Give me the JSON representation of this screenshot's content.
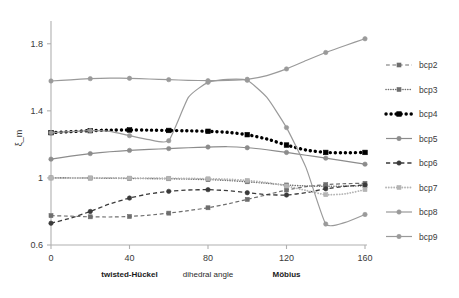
{
  "chart_data": {
    "type": "line",
    "title": "",
    "xlabel": "dihedral angle",
    "ylabel": "ξ_m",
    "xlim": [
      0,
      160
    ],
    "ylim": [
      0.6,
      1.9
    ],
    "xticks": [
      "0",
      "40",
      "80",
      "120",
      "160"
    ],
    "xtick_values": [
      0,
      40,
      80,
      120,
      160
    ],
    "yticks": [
      "0.6",
      "1",
      "1.4",
      "1.8"
    ],
    "ytick_values": [
      0.6,
      1.0,
      1.4,
      1.8
    ],
    "grid": false,
    "legend_position": "right",
    "annotations": [
      {
        "text": "twisted-Hückel",
        "x": 40,
        "bold": true
      },
      {
        "text": "dihedral angle",
        "x": 80,
        "bold": false
      },
      {
        "text": "Möbius",
        "x": 120,
        "bold": true
      }
    ],
    "x": [
      0,
      10,
      20,
      30,
      40,
      50,
      60,
      70,
      80,
      90,
      100,
      110,
      120,
      130,
      140,
      150,
      160
    ],
    "series": [
      {
        "name": "bcp2",
        "style": "dashed",
        "color": "#6e6e6e",
        "width": 1.2,
        "marker": "square",
        "values": [
          0.775,
          0.772,
          0.768,
          0.767,
          0.77,
          0.778,
          0.79,
          0.805,
          0.822,
          0.845,
          0.872,
          0.9,
          0.928,
          0.948,
          0.96,
          0.966,
          0.968
        ]
      },
      {
        "name": "bcp3",
        "style": "dotted",
        "color": "#707070",
        "width": 1.6,
        "marker": "square",
        "values": [
          1.0,
          1.0,
          0.999,
          0.998,
          0.997,
          0.996,
          0.995,
          0.993,
          0.99,
          0.985,
          0.977,
          0.968,
          0.958,
          0.952,
          0.95,
          0.951,
          0.953
        ]
      },
      {
        "name": "bcp4",
        "style": "dotted",
        "color": "#000000",
        "width": 3.4,
        "marker": "square",
        "values": [
          1.27,
          1.276,
          1.282,
          1.285,
          1.286,
          1.285,
          1.283,
          1.281,
          1.278,
          1.272,
          1.258,
          1.232,
          1.196,
          1.166,
          1.152,
          1.15,
          1.152
        ]
      },
      {
        "name": "bcp5",
        "style": "solid",
        "color": "#8c8c8c",
        "width": 1.2,
        "marker": "circle",
        "values": [
          1.112,
          1.13,
          1.145,
          1.156,
          1.164,
          1.17,
          1.175,
          1.18,
          1.184,
          1.186,
          1.18,
          1.168,
          1.152,
          1.135,
          1.118,
          1.1,
          1.082
        ]
      },
      {
        "name": "bcp6",
        "style": "dashed",
        "color": "#3a3a3a",
        "width": 1.3,
        "marker": "circle",
        "values": [
          0.73,
          0.76,
          0.8,
          0.845,
          0.88,
          0.905,
          0.92,
          0.928,
          0.93,
          0.924,
          0.912,
          0.9,
          0.898,
          0.912,
          0.935,
          0.95,
          0.958
        ]
      },
      {
        "name": "bcp7",
        "style": "dotted",
        "color": "#b4b4b4",
        "width": 1.8,
        "marker": "square",
        "values": [
          1.0,
          1.0,
          1.0,
          1.0,
          0.999,
          0.998,
          0.998,
          0.997,
          0.995,
          0.992,
          0.985,
          0.972,
          0.952,
          0.925,
          0.9,
          0.905,
          0.93
        ]
      },
      {
        "name": "bcp8",
        "style": "solid",
        "color": "#9a9a9a",
        "width": 1.2,
        "marker": "circle",
        "values": [
          1.27,
          1.276,
          1.282,
          1.278,
          1.252,
          1.228,
          1.222,
          1.48,
          1.57,
          1.588,
          1.582,
          1.48,
          1.3,
          1.06,
          0.725,
          0.735,
          0.782
        ]
      },
      {
        "name": "bcp9",
        "style": "solid",
        "color": "#9a9a9a",
        "width": 1.2,
        "marker": "circle",
        "values": [
          1.578,
          1.585,
          1.592,
          1.595,
          1.594,
          1.59,
          1.586,
          1.582,
          1.58,
          1.582,
          1.588,
          1.61,
          1.65,
          1.7,
          1.748,
          1.79,
          1.83
        ]
      }
    ]
  },
  "legend": {
    "items": [
      {
        "label": "bcp2"
      },
      {
        "label": "bcp3"
      },
      {
        "label": "bcp4"
      },
      {
        "label": "bcp5"
      },
      {
        "label": "bcp6"
      },
      {
        "label": "bcp7"
      },
      {
        "label": "bcp8"
      },
      {
        "label": "bcp9"
      }
    ]
  }
}
